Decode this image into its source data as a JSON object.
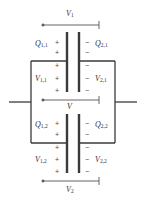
{
  "diagram": {
    "type": "capacitors-in-parallel",
    "colors": {
      "wire": "#3a3a3a",
      "plate": "#3a3a3a",
      "text": "#333333",
      "background": "#ffffff"
    },
    "labels": {
      "V1": {
        "base": "V",
        "sub": "1"
      },
      "V": {
        "base": "V",
        "sub": ""
      },
      "V2": {
        "base": "V",
        "sub": "2"
      },
      "Q11": {
        "base": "Q",
        "sub": "1,1"
      },
      "Q21": {
        "base": "Q",
        "sub": "2,1"
      },
      "V11": {
        "base": "V",
        "sub": "1,1"
      },
      "V21": {
        "base": "V",
        "sub": "2,1"
      },
      "Q12": {
        "base": "Q",
        "sub": "1,2"
      },
      "Q22": {
        "base": "Q",
        "sub": "2,2"
      },
      "V12": {
        "base": "V",
        "sub": "1,2"
      },
      "V22": {
        "base": "V",
        "sub": "2,2"
      }
    },
    "signs": {
      "plus": "+",
      "minus": "−"
    },
    "capacitors": [
      {
        "name": "capacitor-1",
        "left_plate_charge": "+",
        "right_plate_charge": "−"
      },
      {
        "name": "capacitor-2",
        "left_plate_charge": "+",
        "right_plate_charge": "−"
      }
    ]
  }
}
